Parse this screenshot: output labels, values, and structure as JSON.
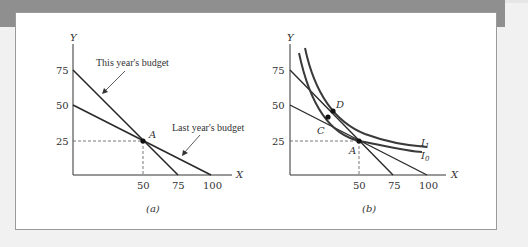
{
  "panel_a": {
    "caption": "(a)",
    "y_axis_label": "Y",
    "x_axis_label": "X",
    "y_ticks": [
      "75",
      "50",
      "25"
    ],
    "x_ticks": [
      "50",
      "75",
      "100"
    ],
    "point_label": "A",
    "this_year_label": "This year's budget",
    "last_year_label": "Last year's budget"
  },
  "panel_b": {
    "caption": "(b)",
    "y_axis_label": "Y",
    "x_axis_label": "X",
    "y_ticks": [
      "75",
      "50",
      "25"
    ],
    "x_ticks": [
      "50",
      "75",
      "100"
    ],
    "point_a": "A",
    "point_c": "C",
    "point_d": "D",
    "curve_i1": "I",
    "curve_i1_sub": "1",
    "curve_i0": "I",
    "curve_i0_sub": "0"
  },
  "colors": {
    "line": "#2a2a2a",
    "curve": "#3a3a3a",
    "dashed": "#555555",
    "frame_band": "#8f8f8f"
  }
}
